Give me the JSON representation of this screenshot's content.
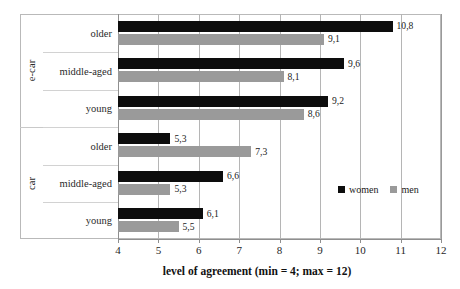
{
  "chart_data": {
    "type": "bar",
    "orientation": "horizontal",
    "title": "",
    "xlabel": "level of agreement (min = 4; max = 12)",
    "ylabel": "",
    "xlim": [
      4,
      12
    ],
    "xticks": [
      "4",
      "5",
      "6",
      "7",
      "8",
      "9",
      "10",
      "11",
      "12"
    ],
    "grid": true,
    "legend_position": "inside-bottom-right",
    "decimal_separator": ",",
    "groups": [
      {
        "name": "e-car",
        "categories": [
          "older",
          "middle-aged",
          "young"
        ]
      },
      {
        "name": "car",
        "categories": [
          "older",
          "middle-aged",
          "young"
        ]
      }
    ],
    "categories": [
      "older",
      "middle-aged",
      "young",
      "older",
      "middle-aged",
      "young"
    ],
    "series": [
      {
        "name": "women",
        "color": "#0d0d0d",
        "values": [
          10.8,
          9.6,
          9.2,
          5.3,
          6.6,
          6.1
        ],
        "labels": [
          "10,8",
          "9,6",
          "9,2",
          "5,3",
          "6,6",
          "6,1"
        ]
      },
      {
        "name": "men",
        "color": "#9a9a9a",
        "values": [
          9.1,
          8.1,
          8.6,
          7.3,
          5.3,
          5.5
        ],
        "labels": [
          "9,1",
          "8,1",
          "8,6",
          "7,3",
          "5,3",
          "5,5"
        ]
      }
    ],
    "rows": [
      {
        "group": "e-car",
        "category": "older",
        "women": 10.8,
        "men": 9.1,
        "women_label": "10,8",
        "men_label": "9,1"
      },
      {
        "group": "e-car",
        "category": "middle-aged",
        "women": 9.6,
        "men": 8.1,
        "women_label": "9,6",
        "men_label": "8,1"
      },
      {
        "group": "e-car",
        "category": "young",
        "women": 9.2,
        "men": 8.6,
        "women_label": "9,2",
        "men_label": "8,6"
      },
      {
        "group": "car",
        "category": "older",
        "women": 5.3,
        "men": 7.3,
        "women_label": "5,3",
        "men_label": "7,3"
      },
      {
        "group": "car",
        "category": "middle-aged",
        "women": 6.6,
        "men": 5.3,
        "women_label": "6,6",
        "men_label": "5,3"
      },
      {
        "group": "car",
        "category": "young",
        "women": 6.1,
        "men": 5.5,
        "women_label": "6,1",
        "men_label": "5,5"
      }
    ]
  },
  "legend": {
    "items": [
      {
        "label": "women",
        "color": "#0d0d0d"
      },
      {
        "label": "men",
        "color": "#9a9a9a"
      }
    ]
  },
  "axis": {
    "x_title": "level of agreement (min = 4; max = 12)",
    "ticks": [
      "4",
      "5",
      "6",
      "7",
      "8",
      "9",
      "10",
      "11",
      "12"
    ]
  },
  "groups": {
    "ecar_label": "e-car",
    "car_label": "car"
  },
  "categories": {
    "r0": "older",
    "r1": "middle-aged",
    "r2": "young",
    "r3": "older",
    "r4": "middle-aged",
    "r5": "young"
  }
}
